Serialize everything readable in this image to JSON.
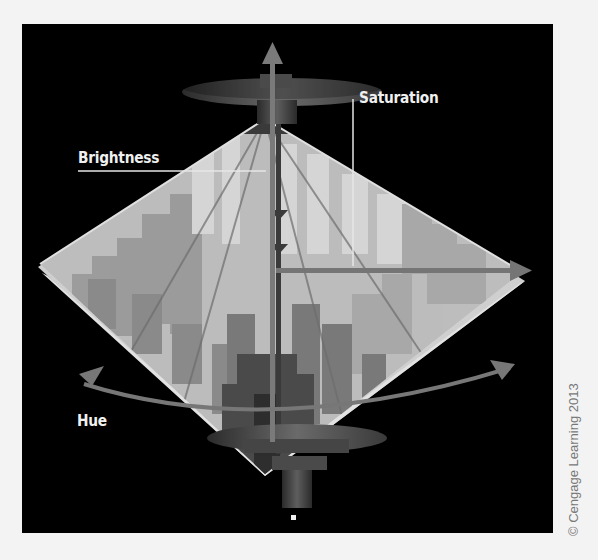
{
  "figure": {
    "labels": {
      "saturation": "Saturation",
      "brightness": "Brightness",
      "hue": "Hue"
    },
    "credit": "© Cengage Learning 2013"
  },
  "colors": {
    "background": "#000000",
    "page": "#f3f3f3",
    "arrow": "#6e6e6e",
    "label_text": "#f0f0f0",
    "leader_line": "#e6e6e6"
  }
}
